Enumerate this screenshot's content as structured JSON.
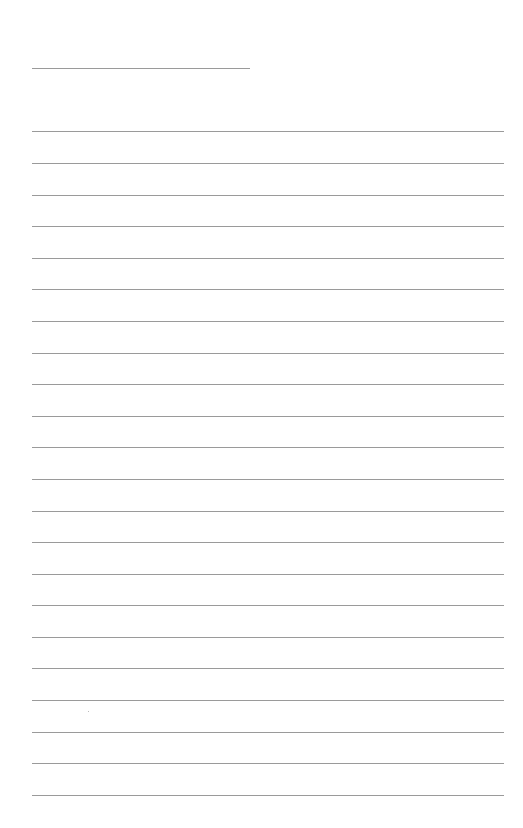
{
  "page": {
    "type": "lined-paper",
    "background": "#ffffff",
    "line_color": "#9a9a9a",
    "header_line": {
      "top": 68,
      "left": 32,
      "width": 218
    },
    "ruled_lines": {
      "count": 22,
      "left": 32,
      "width": 472,
      "tops": [
        131,
        163,
        195,
        226,
        258,
        289,
        321,
        353,
        384,
        416,
        447,
        479,
        511,
        542,
        574,
        605,
        637,
        668,
        700,
        732,
        763,
        795
      ]
    }
  }
}
